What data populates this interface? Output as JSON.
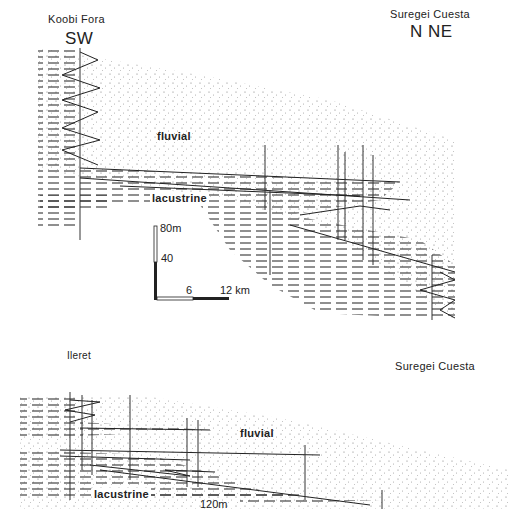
{
  "upper_section": {
    "left_locality": "Koobi Fora",
    "left_direction": "SW",
    "right_locality": "Suregei Cuesta",
    "right_direction": "N NE",
    "facies": {
      "fluvial": "fluvial",
      "lacustrine": "lacustrine"
    },
    "scale_bar": {
      "vertical_top": "80m",
      "vertical_mid": "40",
      "horizontal_mid": "6",
      "horizontal_end": "12 km"
    }
  },
  "lower_section": {
    "left_locality": "Ileret",
    "right_locality": "Suregei Cuesta",
    "facies": {
      "fluvial": "fluvial",
      "lacustrine": "lacustrine"
    },
    "scale_label": "120m"
  },
  "colors": {
    "ink": "#222222",
    "stipple": "#8a8a8a",
    "background": "#ffffff"
  }
}
